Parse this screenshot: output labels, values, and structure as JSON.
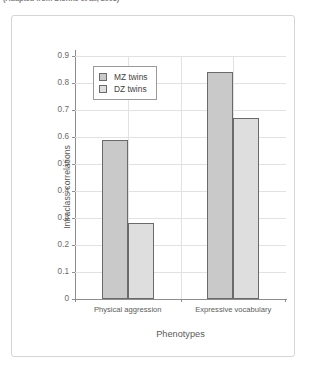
{
  "caption": {
    "text": "(Adapted from Dionne et al., 2003)"
  },
  "chart_data": {
    "type": "bar",
    "title": "",
    "xlabel": "Phenotypes",
    "ylabel": "Intraclass correlations",
    "categories": [
      "Physical aggression",
      "Expressive vocabulary"
    ],
    "series": [
      {
        "name": "MZ twins",
        "values": [
          0.59,
          0.84
        ],
        "color": "#c9c9c9"
      },
      {
        "name": "DZ twins",
        "values": [
          0.28,
          0.67
        ],
        "color": "#dedede"
      }
    ],
    "ylim": [
      0,
      0.9
    ],
    "ytick_labels": [
      "0",
      "0.1",
      "0.2",
      "0.3",
      "0.4",
      "0.5",
      "0.6",
      "0.7",
      "0.8",
      "0.9"
    ],
    "ytick_values": [
      0,
      0.1,
      0.2,
      0.3,
      0.4,
      0.5,
      0.6,
      0.7,
      0.8,
      0.9
    ],
    "grid": true,
    "legend_position": "upper-left-inside",
    "legend_entries": [
      "MZ twins",
      "DZ twins"
    ]
  }
}
